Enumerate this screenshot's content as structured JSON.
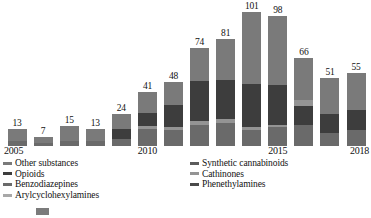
{
  "chart_data": {
    "type": "bar",
    "subtype": "stacked-bar",
    "title": "",
    "xlabel": "",
    "ylabel": "",
    "grid": false,
    "legend_position": "bottom",
    "ylim": [
      0,
      101
    ],
    "categories": [
      "2005",
      "2006",
      "2007",
      "2008",
      "2009",
      "2010",
      "2011",
      "2012",
      "2013",
      "2014",
      "2015",
      "2016",
      "2017",
      "2018"
    ],
    "tick_labels": [
      "2005",
      "",
      "",
      "",
      "",
      "2010",
      "",
      "",
      "",
      "",
      "2015",
      "",
      "",
      "2018"
    ],
    "totals": [
      13,
      7,
      15,
      13,
      24,
      41,
      48,
      74,
      81,
      101,
      98,
      66,
      51,
      55
    ],
    "series": [
      {
        "name": "Other substances",
        "color": "#6e6e6e",
        "values": [
          9,
          5,
          11,
          9,
          9,
          12,
          17,
          22,
          25,
          41,
          35,
          23,
          26,
          26
        ]
      },
      {
        "name": "Synthetic cannabinoids",
        "color": "#5a5a5a",
        "values": [
          0,
          0,
          0,
          0,
          5,
          6,
          7,
          13,
          12,
          25,
          26,
          9,
          0,
          0
        ]
      },
      {
        "name": "Opioids",
        "color": "#3a3a3a",
        "values": [
          0,
          0,
          0,
          0,
          6,
          8,
          11,
          20,
          20,
          24,
          22,
          13,
          14,
          16
        ]
      },
      {
        "name": "Cathinones",
        "color": "#8f8f8f",
        "values": [
          0,
          0,
          0,
          0,
          0,
          2,
          2,
          3,
          3,
          2,
          2,
          5,
          2,
          2
        ]
      },
      {
        "name": "Benzodiazepines",
        "color": "#757575",
        "values": [
          4,
          2,
          4,
          4,
          4,
          13,
          11,
          16,
          21,
          9,
          13,
          16,
          9,
          11
        ]
      },
      {
        "name": "Phenethylamines",
        "color": "#474747",
        "values": [
          0,
          0,
          0,
          0,
          0,
          0,
          0,
          0,
          0,
          0,
          0,
          0,
          0,
          0
        ]
      },
      {
        "name": "Arylcyclohexylamines",
        "color": "#a8a8a8",
        "values": [
          0,
          0,
          0,
          0,
          0,
          0,
          0,
          0,
          0,
          0,
          0,
          0,
          0,
          0
        ]
      }
    ],
    "bars": [
      {
        "year": "2005",
        "total": 13,
        "segments": [
          {
            "name": "Benzodiazepines",
            "value": 4,
            "color": "#6a6a6a"
          },
          {
            "name": "Other substances",
            "value": 9,
            "color": "#7a7a7a"
          }
        ]
      },
      {
        "year": "2006",
        "total": 7,
        "segments": [
          {
            "name": "Benzodiazepines",
            "value": 2,
            "color": "#6a6a6a"
          },
          {
            "name": "Other substances",
            "value": 5,
            "color": "#7a7a7a"
          }
        ]
      },
      {
        "year": "2007",
        "total": 15,
        "segments": [
          {
            "name": "Benzodiazepines",
            "value": 4,
            "color": "#6a6a6a"
          },
          {
            "name": "Other substances",
            "value": 11,
            "color": "#7a7a7a"
          }
        ]
      },
      {
        "year": "2008",
        "total": 13,
        "segments": [
          {
            "name": "Benzodiazepines",
            "value": 4,
            "color": "#6a6a6a"
          },
          {
            "name": "Other substances",
            "value": 9,
            "color": "#7a7a7a"
          }
        ]
      },
      {
        "year": "2009",
        "total": 24,
        "segments": [
          {
            "name": "Benzodiazepines",
            "value": 5,
            "color": "#6a6a6a"
          },
          {
            "name": "Opioids",
            "value": 8,
            "color": "#3d3d3d"
          },
          {
            "name": "Other substances",
            "value": 11,
            "color": "#7a7a7a"
          }
        ]
      },
      {
        "year": "2010",
        "total": 41,
        "segments": [
          {
            "name": "Benzodiazepines",
            "value": 13,
            "color": "#6a6a6a"
          },
          {
            "name": "Cathinones",
            "value": 2,
            "color": "#949494"
          },
          {
            "name": "Opioids",
            "value": 10,
            "color": "#3d3d3d"
          },
          {
            "name": "Other substances",
            "value": 16,
            "color": "#7a7a7a"
          }
        ]
      },
      {
        "year": "2011",
        "total": 48,
        "segments": [
          {
            "name": "Benzodiazepines",
            "value": 12,
            "color": "#6a6a6a"
          },
          {
            "name": "Cathinones",
            "value": 2,
            "color": "#949494"
          },
          {
            "name": "Opioids",
            "value": 17,
            "color": "#3d3d3d"
          },
          {
            "name": "Other substances",
            "value": 17,
            "color": "#7a7a7a"
          }
        ]
      },
      {
        "year": "2012",
        "total": 74,
        "segments": [
          {
            "name": "Benzodiazepines",
            "value": 16,
            "color": "#6a6a6a"
          },
          {
            "name": "Cathinones",
            "value": 3,
            "color": "#949494"
          },
          {
            "name": "Opioids",
            "value": 30,
            "color": "#3d3d3d"
          },
          {
            "name": "Other substances",
            "value": 25,
            "color": "#7a7a7a"
          }
        ]
      },
      {
        "year": "2013",
        "total": 81,
        "segments": [
          {
            "name": "Benzodiazepines",
            "value": 17,
            "color": "#6a6a6a"
          },
          {
            "name": "Cathinones",
            "value": 3,
            "color": "#949494"
          },
          {
            "name": "Opioids",
            "value": 30,
            "color": "#3d3d3d"
          },
          {
            "name": "Other substances",
            "value": 31,
            "color": "#7a7a7a"
          }
        ]
      },
      {
        "year": "2014",
        "total": 101,
        "segments": [
          {
            "name": "Benzodiazepines",
            "value": 12,
            "color": "#6a6a6a"
          },
          {
            "name": "Cathinones",
            "value": 2,
            "color": "#949494"
          },
          {
            "name": "Opioids",
            "value": 33,
            "color": "#3d3d3d"
          },
          {
            "name": "Other substances",
            "value": 54,
            "color": "#7a7a7a"
          }
        ]
      },
      {
        "year": "2015",
        "total": 98,
        "segments": [
          {
            "name": "Benzodiazepines",
            "value": 14,
            "color": "#6a6a6a"
          },
          {
            "name": "Cathinones",
            "value": 2,
            "color": "#949494"
          },
          {
            "name": "Opioids",
            "value": 30,
            "color": "#3d3d3d"
          },
          {
            "name": "Other substances",
            "value": 52,
            "color": "#7a7a7a"
          }
        ]
      },
      {
        "year": "2016",
        "total": 66,
        "segments": [
          {
            "name": "Benzodiazepines",
            "value": 16,
            "color": "#6a6a6a"
          },
          {
            "name": "Opioids",
            "value": 14,
            "color": "#3d3d3d"
          },
          {
            "name": "Cathinones",
            "value": 5,
            "color": "#949494"
          },
          {
            "name": "Other substances",
            "value": 31,
            "color": "#7a7a7a"
          }
        ]
      },
      {
        "year": "2017",
        "total": 51,
        "segments": [
          {
            "name": "Benzodiazepines",
            "value": 10,
            "color": "#6a6a6a"
          },
          {
            "name": "Opioids",
            "value": 14,
            "color": "#3d3d3d"
          },
          {
            "name": "Other substances",
            "value": 27,
            "color": "#7a7a7a"
          }
        ]
      },
      {
        "year": "2018",
        "total": 55,
        "segments": [
          {
            "name": "Benzodiazepines",
            "value": 12,
            "color": "#6a6a6a"
          },
          {
            "name": "Opioids",
            "value": 15,
            "color": "#3d3d3d"
          },
          {
            "name": "Other substances",
            "value": 28,
            "color": "#7a7a7a"
          }
        ]
      }
    ],
    "legend": {
      "left_column": [
        {
          "label": "Other substances",
          "color": "#7a7a7a"
        },
        {
          "label": "Opioids",
          "color": "#3d3d3d"
        },
        {
          "label": "Benzodiazepines",
          "color": "#6a6a6a"
        },
        {
          "label": "Arylcyclohexylamines",
          "color": "#a8a8a8"
        }
      ],
      "right_column": [
        {
          "label": "Synthetic cannabinoids",
          "color": "#5c5c5c"
        },
        {
          "label": "Cathinones",
          "color": "#949494"
        },
        {
          "label": "Phenethylamines",
          "color": "#4a4a4a"
        }
      ]
    }
  },
  "caption": {
    "text": "",
    "badge": "figure-marker"
  }
}
